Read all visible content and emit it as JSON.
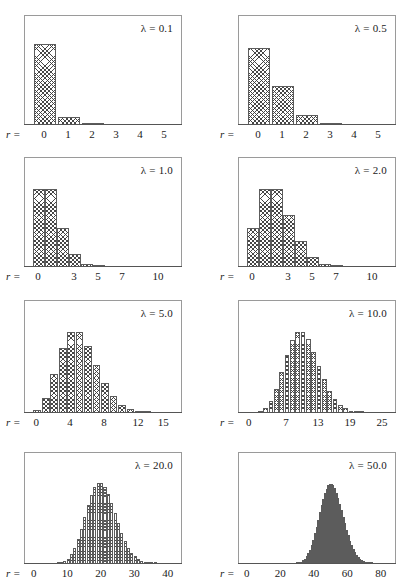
{
  "figure": {
    "title": "",
    "background": "#ffffff",
    "axis_color": "#555555",
    "frame_color": "#9a9a9a",
    "bar_edge_color": "#5c5c5c",
    "bar_fill": "crosshatch",
    "r_prefix": "r =",
    "lambda_symbol": "λ"
  },
  "chart_data": [
    {
      "type": "bar",
      "title": "λ = 0.1",
      "lambda": 0.1,
      "xlabel": "r",
      "ylabel": "",
      "grid": false,
      "legend": "none",
      "xlim": [
        -0.5,
        5.5
      ],
      "tick_labels": [
        "r = 0",
        "1",
        "2",
        "3",
        "4",
        "5"
      ],
      "tick_values": [
        0,
        1,
        2,
        3,
        4,
        5
      ],
      "categories": [
        0,
        1,
        2,
        3,
        4,
        5
      ],
      "values": [
        0.9048,
        0.0905,
        0.0045,
        0.0002,
        0.0,
        0.0
      ],
      "ylim": [
        0,
        1.0
      ]
    },
    {
      "type": "bar",
      "title": "λ = 0.5",
      "lambda": 0.5,
      "xlabel": "r",
      "ylabel": "",
      "grid": false,
      "legend": "none",
      "xlim": [
        -0.5,
        5.5
      ],
      "tick_labels": [
        "r = 0",
        "1",
        "2",
        "3",
        "4",
        "5"
      ],
      "tick_values": [
        0,
        1,
        2,
        3,
        4,
        5
      ],
      "categories": [
        0,
        1,
        2,
        3,
        4,
        5
      ],
      "values": [
        0.6065,
        0.3033,
        0.0758,
        0.0126,
        0.0016,
        0.0002
      ],
      "ylim": [
        0,
        0.7
      ]
    },
    {
      "type": "bar",
      "title": "λ = 1.0",
      "lambda": 1.0,
      "xlabel": "r",
      "ylabel": "",
      "grid": false,
      "legend": "none",
      "xlim": [
        -0.5,
        11.5
      ],
      "tick_labels": [
        "r = 0",
        "3",
        "5",
        "7",
        "10"
      ],
      "tick_values": [
        0,
        3,
        5,
        7,
        10
      ],
      "categories": [
        0,
        1,
        2,
        3,
        4,
        5,
        6,
        7,
        8,
        9,
        10,
        11
      ],
      "values": [
        0.3679,
        0.3679,
        0.1839,
        0.0613,
        0.0153,
        0.0031,
        0.0005,
        0.0001,
        0.0,
        0.0,
        0.0,
        0.0
      ],
      "ylim": [
        0,
        0.42
      ]
    },
    {
      "type": "bar",
      "title": "λ = 2.0",
      "lambda": 2.0,
      "xlabel": "r",
      "ylabel": "",
      "grid": false,
      "legend": "none",
      "xlim": [
        -0.5,
        11.5
      ],
      "tick_labels": [
        "r = 0",
        "3",
        "5",
        "7",
        "10"
      ],
      "tick_values": [
        0,
        3,
        5,
        7,
        10
      ],
      "categories": [
        0,
        1,
        2,
        3,
        4,
        5,
        6,
        7,
        8,
        9,
        10,
        11
      ],
      "values": [
        0.1353,
        0.2707,
        0.2707,
        0.1804,
        0.0902,
        0.0361,
        0.012,
        0.0034,
        0.0009,
        0.0002,
        0.0,
        0.0
      ],
      "ylim": [
        0,
        0.31
      ]
    },
    {
      "type": "bar",
      "title": "λ = 5.0",
      "lambda": 5.0,
      "xlabel": "r",
      "ylabel": "",
      "grid": false,
      "legend": "none",
      "xlim": [
        -0.5,
        16.5
      ],
      "tick_labels": [
        "r = 0",
        "4",
        "8",
        "12",
        "15"
      ],
      "tick_values": [
        0,
        4,
        8,
        12,
        15
      ],
      "categories": [
        0,
        1,
        2,
        3,
        4,
        5,
        6,
        7,
        8,
        9,
        10,
        11,
        12,
        13,
        14,
        15,
        16
      ],
      "values": [
        0.0067,
        0.0337,
        0.0842,
        0.1404,
        0.1755,
        0.1755,
        0.1462,
        0.1044,
        0.0653,
        0.0363,
        0.0181,
        0.0082,
        0.0034,
        0.0013,
        0.0005,
        0.0002,
        0.0
      ],
      "ylim": [
        0,
        0.2
      ]
    },
    {
      "type": "bar",
      "title": "λ = 10.0",
      "lambda": 10.0,
      "xlabel": "r",
      "ylabel": "",
      "grid": false,
      "legend": "none",
      "xlim": [
        -0.5,
        26.5
      ],
      "tick_labels": [
        "r = 0",
        "7",
        "13",
        "19",
        "25"
      ],
      "tick_values": [
        0,
        7,
        13,
        19,
        25
      ],
      "categories": [
        0,
        1,
        2,
        3,
        4,
        5,
        6,
        7,
        8,
        9,
        10,
        11,
        12,
        13,
        14,
        15,
        16,
        17,
        18,
        19,
        20,
        21,
        22,
        23,
        24,
        25,
        26
      ],
      "values": [
        0.0,
        0.0005,
        0.0023,
        0.0076,
        0.0189,
        0.0378,
        0.0631,
        0.0901,
        0.1126,
        0.1251,
        0.1251,
        0.1137,
        0.0948,
        0.0729,
        0.0521,
        0.0347,
        0.0217,
        0.0128,
        0.0071,
        0.0037,
        0.0019,
        0.0009,
        0.0004,
        0.0002,
        0.0001,
        0.0,
        0.0
      ],
      "ylim": [
        0,
        0.142
      ]
    },
    {
      "type": "bar",
      "title": "λ = 20.0",
      "lambda": 20.0,
      "xlabel": "r",
      "ylabel": "",
      "grid": false,
      "legend": "none",
      "xlim": [
        -0.5,
        42.5
      ],
      "tick_labels": [
        "r = 0",
        "10",
        "20",
        "30",
        "40"
      ],
      "tick_values": [
        0,
        10,
        20,
        30,
        40
      ],
      "categories": [
        0,
        1,
        2,
        3,
        4,
        5,
        6,
        7,
        8,
        9,
        10,
        11,
        12,
        13,
        14,
        15,
        16,
        17,
        18,
        19,
        20,
        21,
        22,
        23,
        24,
        25,
        26,
        27,
        28,
        29,
        30,
        31,
        32,
        33,
        34,
        35,
        36,
        37,
        38,
        39,
        40,
        41,
        42
      ],
      "values": [
        0.0,
        0.0,
        0.0,
        0.0,
        0.0,
        0.0001,
        0.0002,
        0.0005,
        0.0013,
        0.0029,
        0.0058,
        0.0106,
        0.0176,
        0.0271,
        0.0387,
        0.0516,
        0.0646,
        0.076,
        0.0844,
        0.0888,
        0.0888,
        0.0846,
        0.0769,
        0.0669,
        0.0557,
        0.0446,
        0.0343,
        0.0254,
        0.0181,
        0.0125,
        0.0083,
        0.0054,
        0.0034,
        0.002,
        0.0012,
        0.0007,
        0.0004,
        0.0002,
        0.0001,
        0.0001,
        0.0,
        0.0,
        0.0
      ],
      "ylim": [
        0,
        0.1
      ]
    },
    {
      "type": "bar",
      "title": "λ = 50.0",
      "lambda": 50.0,
      "xlabel": "r",
      "ylabel": "",
      "grid": false,
      "legend": "none",
      "xlim": [
        -0.5,
        85.5
      ],
      "tick_labels": [
        "r = 0",
        "20",
        "40",
        "60",
        "80"
      ],
      "tick_values": [
        0,
        20,
        40,
        60,
        80
      ],
      "categories": [
        0,
        1,
        2,
        3,
        4,
        5,
        6,
        7,
        8,
        9,
        10,
        11,
        12,
        13,
        14,
        15,
        16,
        17,
        18,
        19,
        20,
        21,
        22,
        23,
        24,
        25,
        26,
        27,
        28,
        29,
        30,
        31,
        32,
        33,
        34,
        35,
        36,
        37,
        38,
        39,
        40,
        41,
        42,
        43,
        44,
        45,
        46,
        47,
        48,
        49,
        50,
        51,
        52,
        53,
        54,
        55,
        56,
        57,
        58,
        59,
        60,
        61,
        62,
        63,
        64,
        65,
        66,
        67,
        68,
        69,
        70,
        71,
        72,
        73,
        74,
        75,
        76,
        77,
        78,
        79,
        80,
        81,
        82,
        83,
        84,
        85
      ],
      "values": [
        0.0,
        0.0,
        0.0,
        0.0,
        0.0,
        0.0,
        0.0,
        0.0,
        0.0,
        0.0,
        0.0,
        0.0,
        0.0,
        0.0,
        0.0,
        0.0,
        0.0,
        0.0,
        0.0,
        0.0,
        0.0,
        0.0,
        0.0,
        0.0,
        0.0001,
        0.0001,
        0.0002,
        0.0004,
        0.0007,
        0.0013,
        0.0021,
        0.0034,
        0.0053,
        0.0081,
        0.0119,
        0.017,
        0.0236,
        0.0319,
        0.042,
        0.0538,
        0.0673,
        0.0821,
        0.0977,
        0.1136,
        0.1291,
        0.1434,
        0.1559,
        0.1658,
        0.1726,
        0.1762,
        0.1762,
        0.1727,
        0.1661,
        0.1567,
        0.1451,
        0.1319,
        0.1178,
        0.1033,
        0.0891,
        0.0755,
        0.0629,
        0.0516,
        0.0416,
        0.033,
        0.0258,
        0.0198,
        0.015,
        0.0112,
        0.0082,
        0.006,
        0.0043,
        0.003,
        0.0021,
        0.0014,
        0.001,
        0.0006,
        0.0004,
        0.0003,
        0.0002,
        0.0001,
        0.0001,
        0.0,
        0.0,
        0.0,
        0.0,
        0.0
      ],
      "ylim": [
        0,
        0.2
      ]
    }
  ],
  "panels": [
    {
      "id": "panel-lambda-0-1",
      "label": "λ = 0.1",
      "lambda_text": "0.1",
      "axis_caption": "r =",
      "tick_labels": [
        "0",
        "1",
        "2",
        "3",
        "4",
        "5"
      ]
    },
    {
      "id": "panel-lambda-0-5",
      "label": "λ = 0.5",
      "lambda_text": "0.5",
      "axis_caption": "r =",
      "tick_labels": [
        "0",
        "1",
        "2",
        "3",
        "4",
        "5"
      ]
    },
    {
      "id": "panel-lambda-1-0",
      "label": "λ = 1.0",
      "lambda_text": "1.0",
      "axis_caption": "r =",
      "tick_labels": [
        "0",
        "3",
        "5",
        "7",
        "10"
      ]
    },
    {
      "id": "panel-lambda-2-0",
      "label": "λ = 2.0",
      "lambda_text": "2.0",
      "axis_caption": "r =",
      "tick_labels": [
        "0",
        "3",
        "5",
        "7",
        "10"
      ]
    },
    {
      "id": "panel-lambda-5-0",
      "label": "λ = 5.0",
      "lambda_text": "5.0",
      "axis_caption": "r =",
      "tick_labels": [
        "0",
        "4",
        "8",
        "12",
        "15"
      ]
    },
    {
      "id": "panel-lambda-10-0",
      "label": "λ = 10.0",
      "lambda_text": "10.0",
      "axis_caption": "r =",
      "tick_labels": [
        "0",
        "7",
        "13",
        "19",
        "25"
      ]
    },
    {
      "id": "panel-lambda-20-0",
      "label": "λ = 20.0",
      "lambda_text": "20.0",
      "axis_caption": "r =",
      "tick_labels": [
        "0",
        "10",
        "20",
        "30",
        "40"
      ]
    },
    {
      "id": "panel-lambda-50-0",
      "label": "λ = 50.0",
      "lambda_text": "50.0",
      "axis_caption": "r =",
      "tick_labels": [
        "0",
        "20",
        "40",
        "60",
        "80"
      ]
    }
  ],
  "layout": {
    "columns": 2,
    "rows": 4,
    "panel_geometry": [
      {
        "x": 24,
        "y": 15,
        "w": 158,
        "h": 110
      },
      {
        "x": 238,
        "y": 15,
        "w": 158,
        "h": 110
      },
      {
        "x": 24,
        "y": 157,
        "w": 158,
        "h": 110
      },
      {
        "x": 238,
        "y": 157,
        "w": 158,
        "h": 110
      },
      {
        "x": 24,
        "y": 300,
        "w": 158,
        "h": 113
      },
      {
        "x": 238,
        "y": 300,
        "w": 158,
        "h": 113
      },
      {
        "x": 24,
        "y": 452,
        "w": 158,
        "h": 112
      },
      {
        "x": 238,
        "y": 452,
        "w": 158,
        "h": 112
      }
    ]
  }
}
